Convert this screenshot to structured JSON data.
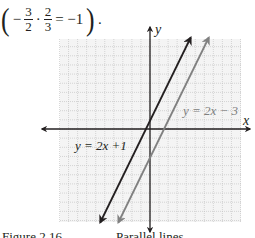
{
  "equation": {
    "open_paren": "(",
    "minus": "−",
    "frac1_num": "3",
    "frac1_den": "2",
    "dot": "·",
    "frac2_num": "2",
    "frac2_den": "3",
    "rhs": "= −1",
    "close_paren": ")",
    "period": "."
  },
  "figure": {
    "x_axis_label": "x",
    "y_axis_label": "y",
    "line1_label": "y = 2x +1",
    "line2_label": "y = 2x − 3",
    "line1_color": "#231f20",
    "line2_color": "#808080",
    "grid_color": "#bdbdbd",
    "axis_color": "#231f20"
  },
  "caption": {
    "left": "Figure 2.16",
    "center": "Parallel lines"
  },
  "chart_data": {
    "type": "line",
    "title": "Parallel lines",
    "xlabel": "x",
    "ylabel": "y",
    "xlim": [
      -10,
      10
    ],
    "ylim": [
      -10,
      10
    ],
    "grid": true,
    "series": [
      {
        "name": "y = 2x +1",
        "slope": 2,
        "intercept": 1,
        "x": [
          -5.5,
          4.5
        ],
        "y": [
          -10,
          10
        ]
      },
      {
        "name": "y = 2x − 3",
        "slope": 2,
        "intercept": -3,
        "x": [
          -3.5,
          6.5
        ],
        "y": [
          -10,
          10
        ]
      }
    ]
  }
}
